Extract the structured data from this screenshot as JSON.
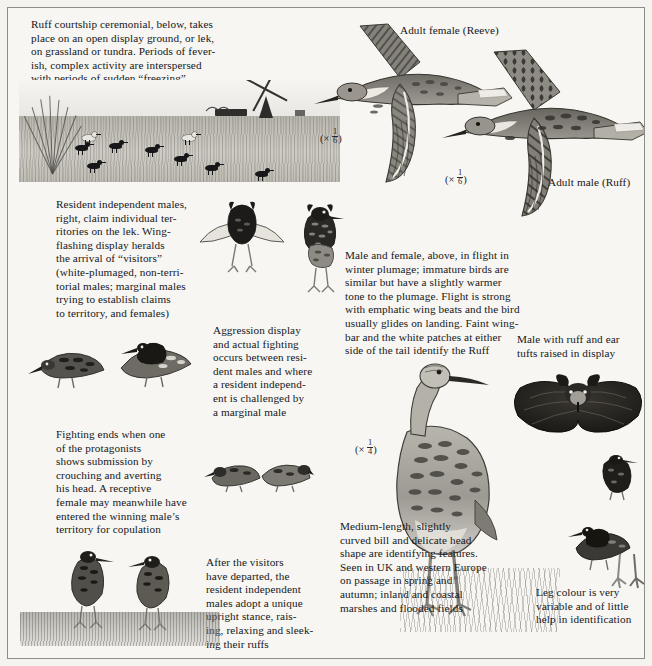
{
  "plate": {
    "title_note": "Ruff plate — courtship, flight and identification",
    "background_hex": "#f7f6f3",
    "ink_hex": "#16161a",
    "border_hex": "#8d8d88"
  },
  "captions": {
    "intro": "Ruff courtship ceremonial, below, takes\nplace on an open display ground, or lek,\non grassland or tundra. Periods of fever-\nish, complex activity are interspersed\nwith periods of sudden “freezing”",
    "adult_female": "Adult female (Reeve)",
    "adult_male": "Adult male (Ruff)",
    "resident_males": "Resident independent males,\nright, claim individual ter-\nritories on the lek. Wing-\nflashing display heralds\nthe arrival of “visitors”\n(white-plumaged, non-terri-\ntorial males; marginal males\ntrying to establish claims\nto territory, and females)",
    "aggression": "Aggression display\nand actual fighting\noccurs between resi-\ndent males and where\na resident independ-\nent is challenged by\na marginal male",
    "flight": "Male and female, above, in flight in\nwinter plumage; immature birds are\nsimilar but have a slightly warmer\ntone to the plumage. Flight is strong\nwith emphatic wing beats and the bird\nusually glides on landing. Faint wing-\nbar and the white patches at either\nside of the tail identify the Ruff",
    "ruff_ear_tufts": "Male with ruff and ear\ntufts raised in display",
    "fighting_ends": "Fighting ends when one\nof the protagonists\nshows submission by\ncrouching and averting\nhis head. A receptive\nfemale may meanwhile have\nentered the winning male’s\nterritory for copulation",
    "after_visitors": "After the visitors\nhave departed, the\nresident independent\nmales adopt a unique\nupright stance, rais-\ning, relaxing and sleek-\ning their ruffs",
    "identification": "Medium-length, slightly\ncurved bill and delicate head\nshape are identifying features.\nSeen in UK and western Europe\non passage in spring and\nautumn; inland and coastal\nmarshes and flooded fields",
    "leg_colour": "Leg colour is very\nvariable and of little\nhelp in identification"
  },
  "scales": {
    "female_flight": {
      "times": "×",
      "numerator": "1",
      "denominator": "6"
    },
    "male_flight": {
      "times": "×",
      "numerator": "1",
      "denominator": "6"
    },
    "standing": {
      "times": "×",
      "numerator": "1",
      "denominator": "4"
    }
  },
  "figures": {
    "lek_scene": "lek-landscape-with-windmill",
    "flying_female": "ruff-in-flight-female",
    "flying_male": "ruff-in-flight-male",
    "wing_flashing": "wing-flashing-display-male",
    "ruffed_male": "standing-ruffed-male",
    "fighting_pair": "fighting-males-pair",
    "crouching_pair": "submission-crouch-pair",
    "upright_pair": "upright-stance-males",
    "standing_reeve": "large-standing-reeve",
    "head_ruff": "head-with-ruff-and-ear-tufts",
    "small_ruff_a": "small-display-male-a",
    "small_ruff_b": "small-display-male-b",
    "leg_study": "leg-colour-study"
  }
}
